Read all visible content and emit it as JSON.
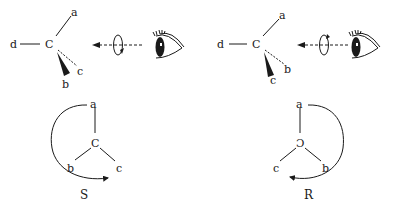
{
  "diagram": {
    "left": {
      "top": {
        "center": "C",
        "substituents": {
          "up_right": "a",
          "left": "d",
          "wedge": "b",
          "dash": "c"
        }
      },
      "bottom": {
        "center": "C",
        "top": "a",
        "bottom_left": "b",
        "bottom_right": "c",
        "direction": "counterclockwise",
        "result": "S"
      }
    },
    "right": {
      "top": {
        "center": "C",
        "substituents": {
          "up_right": "a",
          "left": "d",
          "wedge": "c",
          "dash": "b"
        }
      },
      "bottom": {
        "center": "Ɔ",
        "top": "a",
        "bottom_left": "c",
        "bottom_right": "b",
        "direction": "clockwise",
        "result": "R"
      }
    }
  }
}
